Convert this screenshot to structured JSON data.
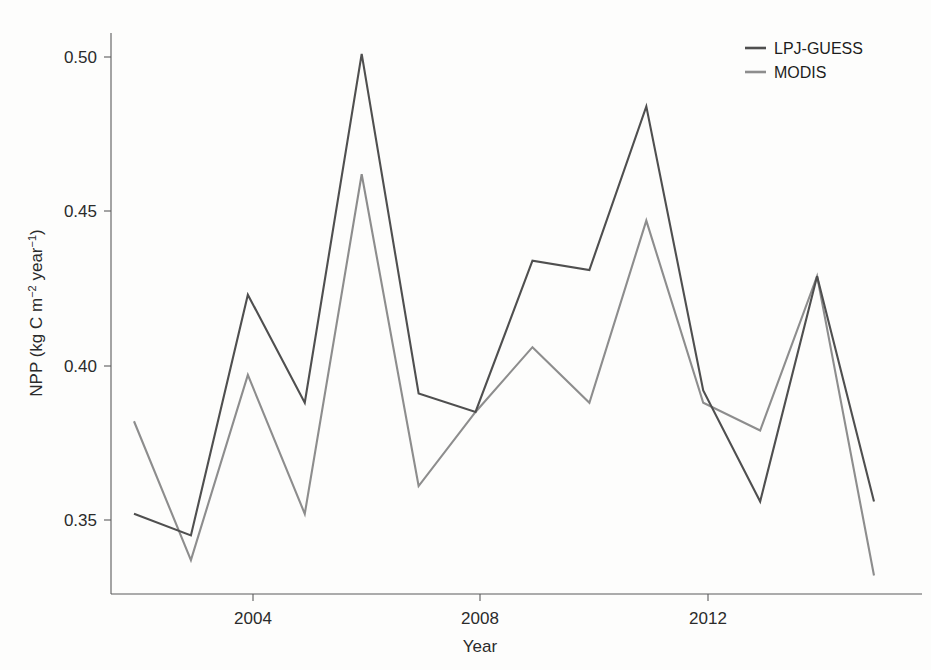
{
  "chart_data": {
    "type": "line",
    "title": "",
    "subtitle": "",
    "xlabel": "Year",
    "ylabel": "NPP (kg C m⁻² year⁻¹)",
    "ylabel_parts": {
      "prefix": "NPP (kg C m",
      "sup1": "−2",
      "mid": " year",
      "sup2": "−1",
      "suffix": ")"
    },
    "x": [
      2002,
      2003,
      2004,
      2005,
      2006,
      2007,
      2008,
      2009,
      2010,
      2011,
      2012,
      2013,
      2014,
      2015
    ],
    "xlim": [
      2002,
      2015
    ],
    "ylim": [
      0.325,
      0.513
    ],
    "xticks": [
      2004,
      2008,
      2012
    ],
    "xticklabels": [
      "2004",
      "2008",
      "2012"
    ],
    "yticks": [
      0.35,
      0.4,
      0.45,
      0.5
    ],
    "yticklabels": [
      "0.35",
      "0.40",
      "0.45",
      "0.50"
    ],
    "grid": false,
    "legend_position": "top-right",
    "series": [
      {
        "name": "LPJ-GUESS",
        "color": "#4f4f4f",
        "values": [
          0.352,
          0.345,
          0.423,
          0.388,
          0.501,
          0.391,
          0.385,
          0.434,
          0.431,
          0.484,
          0.392,
          0.356,
          0.429,
          0.356
        ]
      },
      {
        "name": "MODIS",
        "color": "#8d8d8d",
        "values": [
          0.382,
          0.337,
          0.397,
          0.352,
          0.462,
          0.361,
          0.385,
          0.406,
          0.388,
          0.447,
          0.388,
          0.379,
          0.429,
          0.332
        ]
      }
    ]
  },
  "legend": {
    "entries": [
      {
        "label": "LPJ-GUESS",
        "color": "#4f4f4f"
      },
      {
        "label": "MODIS",
        "color": "#8d8d8d"
      }
    ]
  },
  "axes": {
    "x_title": "Year",
    "y_title": "NPP (kg C m⁻² year⁻¹)",
    "x_tick_labels": [
      "2004",
      "2008",
      "2012"
    ],
    "y_tick_labels": [
      "0.35",
      "0.40",
      "0.45",
      "0.50"
    ]
  }
}
